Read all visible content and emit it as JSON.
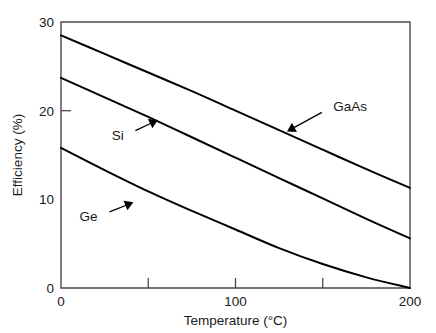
{
  "chart_data": {
    "type": "line",
    "title": "",
    "subtitle": "",
    "xlabel": "Temperature (°C)",
    "ylabel": "Efficiency (%)",
    "xlim": [
      0,
      200
    ],
    "ylim": [
      0,
      30
    ],
    "grid": false,
    "legend_position": "inline-annotations",
    "x_ticks": [
      0,
      50,
      100,
      150,
      200
    ],
    "x_tick_labels": [
      "0",
      "",
      "100",
      "",
      "200"
    ],
    "y_ticks": [
      0,
      10,
      20,
      30
    ],
    "y_tick_labels": [
      "0",
      "10",
      "20",
      "30"
    ],
    "x": [
      0,
      25,
      50,
      75,
      100,
      125,
      150,
      175,
      200
    ],
    "series": [
      {
        "name": "GaAs",
        "values": [
          28.5,
          26.4,
          24.3,
          22.2,
          20.0,
          17.8,
          15.6,
          13.4,
          11.3
        ]
      },
      {
        "name": "Si",
        "values": [
          23.7,
          21.5,
          19.3,
          17.0,
          14.7,
          12.4,
          10.1,
          7.8,
          5.6
        ]
      },
      {
        "name": "Ge",
        "values": [
          15.8,
          13.3,
          10.9,
          8.7,
          6.6,
          4.5,
          2.7,
          1.2,
          0.0
        ]
      }
    ],
    "annotations": [
      {
        "text": "GaAs",
        "label_x": 154,
        "label_y": 20.3,
        "point_x": 129,
        "point_y": 17.6
      },
      {
        "text": "Si",
        "label_x": 38,
        "label_y": 17.3,
        "point_x": 56,
        "point_y": 19.0
      },
      {
        "text": "Ge",
        "label_x": 23,
        "label_y": 8.2,
        "point_x": 42,
        "point_y": 9.7
      }
    ],
    "colors": {
      "curve": "#000000",
      "axis": "#4a4a4a",
      "text": "#1a1a1a",
      "background": "#ffffff"
    }
  }
}
